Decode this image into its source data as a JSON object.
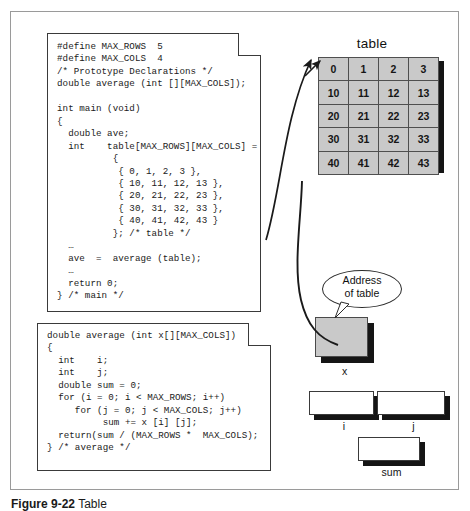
{
  "figure": {
    "caption_label": "Figure 9-22",
    "caption_text": "Table",
    "table_title": "table"
  },
  "code_main": {
    "title": "main-function-source",
    "text": "#define MAX_ROWS  5\n#define MAX_COLS  4\n/* Prototype Declarations */\ndouble average (int [][MAX_COLS]);\n\nint main (void)\n{\n  double ave;\n  int    table[MAX_ROWS][MAX_COLS] =\n          {\n           { 0, 1, 2, 3 },\n           { 10, 11, 12, 13 },\n           { 20, 21, 22, 23 },\n           { 30, 31, 32, 33 },\n           { 40, 41, 42, 43 }\n          }; /* table */\n  …\n  ave  =  average (table);\n  …\n  return 0;\n} /* main */"
  },
  "code_average": {
    "title": "average-function-source",
    "text": "double average (int x[][MAX_COLS])\n{\n  int    i;\n  int    j;\n  double sum = 0;\n  for (i = 0; i < MAX_ROWS; i++)\n     for (j = 0; j < MAX_COLS; j++)\n          sum += x [i] [j];\n  return(sum / (MAX_ROWS *  MAX_COLS);\n} /* average */"
  },
  "table": {
    "label": "table",
    "rows": [
      [
        "0",
        "1",
        "2",
        "3"
      ],
      [
        "10",
        "11",
        "12",
        "13"
      ],
      [
        "20",
        "21",
        "22",
        "23"
      ],
      [
        "30",
        "31",
        "32",
        "33"
      ],
      [
        "40",
        "41",
        "42",
        "43"
      ]
    ]
  },
  "callout": {
    "line1": "Address",
    "line2": "of table"
  },
  "variables": {
    "x": "x",
    "i": "i",
    "j": "j",
    "sum": "sum"
  },
  "colors": {
    "cell_fill": "#c9c9c9",
    "shadow": "#151515",
    "border": "#3a3a3a",
    "frame": "#9a9a9a",
    "text": "#1a1a1a"
  }
}
